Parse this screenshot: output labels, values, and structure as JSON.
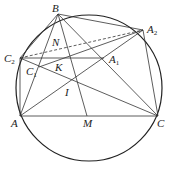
{
  "diagram": {
    "circle": {
      "cx": 89,
      "cy": 88,
      "r": 73
    },
    "points": {
      "B": {
        "x": 58,
        "y": 14,
        "label": "B",
        "sub": "",
        "lx": 52,
        "ly": 12
      },
      "A2": {
        "x": 143,
        "y": 30,
        "label": "A",
        "sub": "2",
        "lx": 147,
        "ly": 33
      },
      "C2": {
        "x": 20,
        "y": 58,
        "label": "C",
        "sub": "2",
        "lx": 4,
        "ly": 62
      },
      "A1": {
        "x": 104,
        "y": 58,
        "label": "A",
        "sub": "1",
        "lx": 109,
        "ly": 63
      },
      "C1": {
        "x": 39,
        "y": 67,
        "label": "C",
        "sub": "1",
        "lx": 26,
        "ly": 75
      },
      "N": {
        "x": 60,
        "y": 48,
        "label": "N",
        "sub": "",
        "lx": 52,
        "ly": 46
      },
      "K": {
        "x": 64,
        "y": 60,
        "label": "K",
        "sub": "",
        "lx": 55,
        "ly": 71
      },
      "I": {
        "x": 72,
        "y": 80,
        "label": "I",
        "sub": "",
        "lx": 65,
        "ly": 96
      },
      "A": {
        "x": 20,
        "y": 116,
        "label": "A",
        "sub": "",
        "lx": 11,
        "ly": 127
      },
      "M": {
        "x": 87,
        "y": 116,
        "label": "M",
        "sub": "",
        "lx": 83,
        "ly": 127
      },
      "C": {
        "x": 158,
        "y": 116,
        "label": "C",
        "sub": "",
        "lx": 157,
        "ly": 127
      }
    },
    "solid_segments": [
      [
        "A",
        "B"
      ],
      [
        "B",
        "C"
      ],
      [
        "A",
        "C"
      ],
      [
        "A",
        "A2"
      ],
      [
        "C",
        "C2"
      ],
      [
        "B",
        "A2"
      ],
      [
        "A2",
        "C"
      ],
      [
        "C2",
        "A1"
      ],
      [
        "C2",
        "A"
      ],
      [
        "C2",
        "B"
      ],
      [
        "C1",
        "A2"
      ],
      [
        "B",
        "M"
      ]
    ],
    "dashed_segments": [
      [
        "C2",
        "A2"
      ]
    ]
  }
}
